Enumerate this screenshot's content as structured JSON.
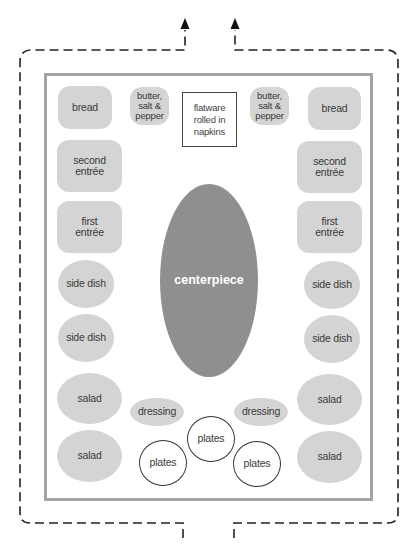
{
  "diagram": {
    "type": "buffet table layout",
    "colors": {
      "food_fill": "#d4d4d4",
      "centerpiece_fill": "#8f8f8f",
      "table_border": "#a3a3a3",
      "flow_line": "#222222"
    },
    "flow": {
      "description": "Dashed flow path: guests enter from bottom, split left/right around the table, exit at top",
      "entry_arrows": 2,
      "exit_arrows": 2
    },
    "table": {
      "top_row": {
        "left_bread": "bread",
        "left_condiments": "butter,\nsalt &\npepper",
        "flatware": "flatware\nrolled in\nnapkins",
        "right_condiments": "butter,\nsalt &\npepper",
        "right_bread": "bread"
      },
      "left_column": [
        "second\nentrée",
        "first\nentrée",
        "side dish",
        "side dish",
        "salad",
        "salad"
      ],
      "right_column": [
        "second\nentrée",
        "first\nentrée",
        "side dish",
        "side dish",
        "salad",
        "salad"
      ],
      "centerpiece": "centerpiece",
      "dressings": [
        "dressing",
        "dressing"
      ],
      "plates": [
        "plates",
        "plates",
        "plates"
      ]
    }
  }
}
